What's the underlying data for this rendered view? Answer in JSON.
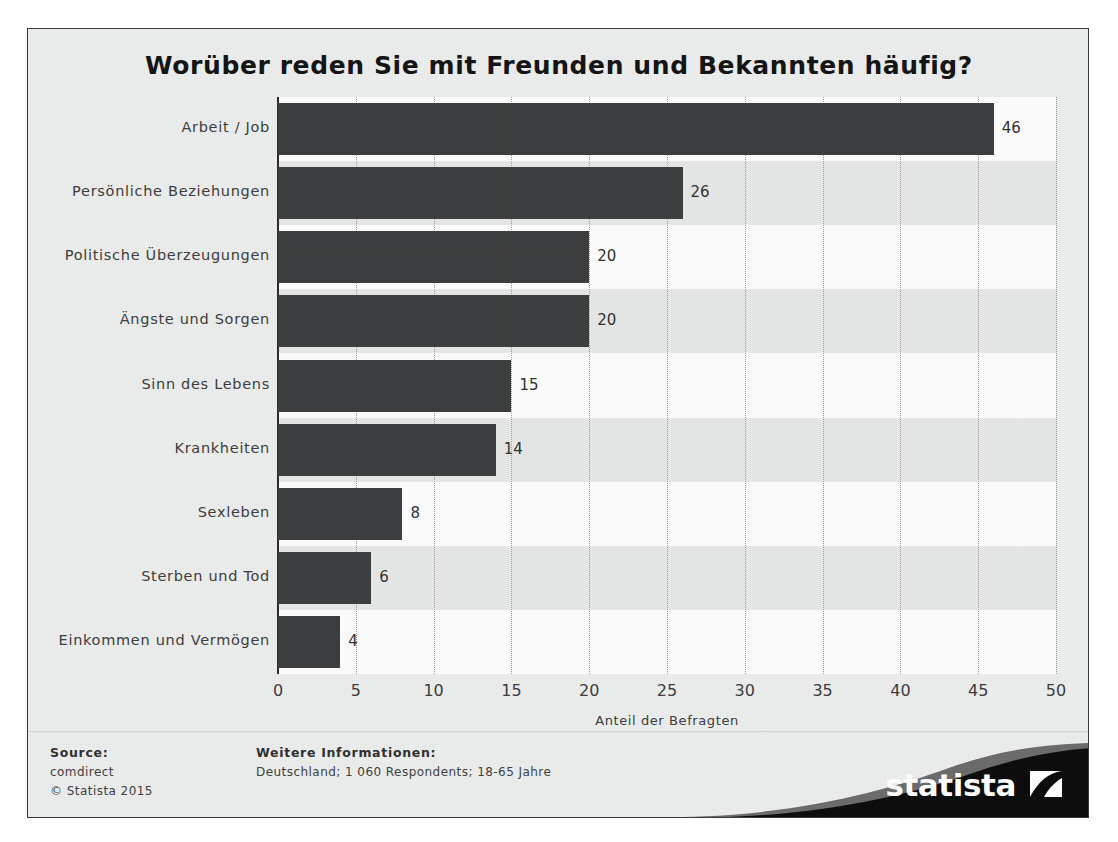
{
  "chart_data": {
    "type": "bar",
    "orientation": "horizontal",
    "title": "Worüber reden Sie mit Freunden und Bekannten häufig?",
    "categories": [
      "Arbeit / Job",
      "Persönliche Beziehungen",
      "Politische Überzeugungen",
      "Ängste und Sorgen",
      "Sinn des Lebens",
      "Krankheiten",
      "Sexleben",
      "Sterben und Tod",
      "Einkommen und Vermögen"
    ],
    "values": [
      46,
      26,
      20,
      20,
      15,
      14,
      8,
      6,
      4
    ],
    "value_labels": [
      "46",
      "26",
      "20",
      "20",
      "15",
      "14",
      "8",
      "6",
      "4"
    ],
    "xlabel": "Anteil der Befragten",
    "ylabel": "",
    "xlim": [
      0,
      50
    ],
    "xticks": [
      0,
      5,
      10,
      15,
      20,
      25,
      30,
      35,
      40,
      45,
      50
    ],
    "xtick_labels": [
      "0",
      "5",
      "10",
      "15",
      "20",
      "25",
      "30",
      "35",
      "40",
      "45",
      "50"
    ],
    "grid": "vertical-dotted",
    "legend": "none",
    "bar_color": "#3b3c3d",
    "band_color_alt": "#e6e7e7",
    "band_color": "#fdfdfd",
    "background": "#eceded"
  },
  "footer": {
    "source_heading": "Source:",
    "source_name": "comdirect",
    "copyright": "© Statista 2015",
    "info_heading": "Weitere Informationen:",
    "info_line": "Deutschland; 1 060 Respondents; 18-65 Jahre"
  },
  "brand": {
    "name": "statista"
  }
}
